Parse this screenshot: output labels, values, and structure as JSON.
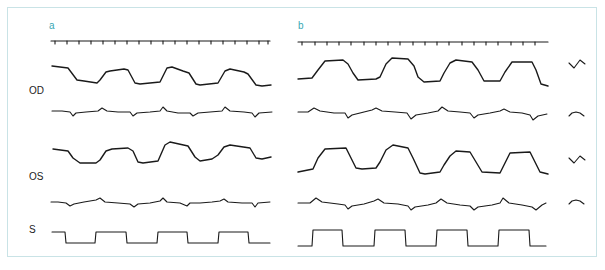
{
  "figure": {
    "panels": [
      {
        "label": "a"
      },
      {
        "label": "b"
      }
    ],
    "row_labels": {
      "od": "OD",
      "os": "OS",
      "s": "S"
    },
    "calibration_icons": [
      "position-calibration-icon",
      "velocity-calibration-icon",
      "position-calibration-icon",
      "velocity-calibration-icon"
    ],
    "colors": {
      "panel_label": "#3aa7b4",
      "border": "#c9e3e6",
      "trace": "#1a1a1a"
    },
    "rows": [
      "time-marker",
      "OD-position",
      "OD-velocity",
      "OS-position",
      "OS-velocity",
      "stimulus"
    ],
    "cycles_per_panel": 4
  }
}
